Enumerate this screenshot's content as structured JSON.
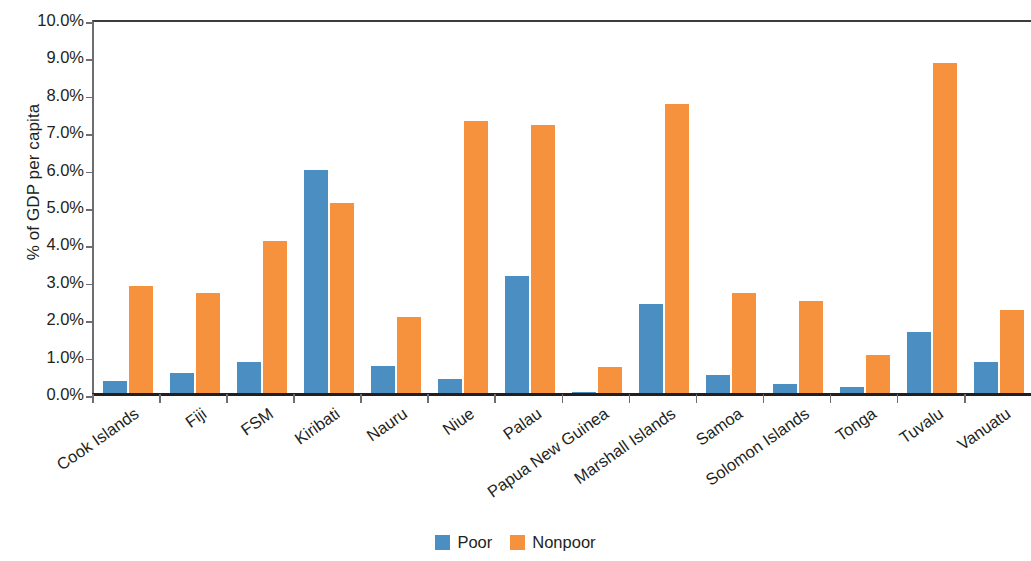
{
  "chart_data": {
    "type": "bar",
    "title": "",
    "xlabel": "",
    "ylabel": "% of GDP per capita",
    "ylim": [
      0,
      10
    ],
    "ytick_labels": [
      "10.0%",
      "9.0%",
      "8.0%",
      "7.0%",
      "6.0%",
      "5.0%",
      "4.0%",
      "3.0%",
      "2.0%",
      "1.0%",
      "0.0%"
    ],
    "ytick_values": [
      10,
      9,
      8,
      7,
      6,
      5,
      4,
      3,
      2,
      1,
      0
    ],
    "grid": false,
    "legend_position": "bottom-center",
    "categories": [
      "Cook Islands",
      "Fiji",
      "FSM",
      "Kiribati",
      "Nauru",
      "Niue",
      "Palau",
      "Papua New Guinea",
      "Marshall Islands",
      "Samoa",
      "Solomon Islands",
      "Tonga",
      "Tuvalu",
      "Vanuatu"
    ],
    "series": [
      {
        "name": "Poor",
        "color": "#4a8ec2",
        "values": [
          0.35,
          0.55,
          0.85,
          6.0,
          0.75,
          0.4,
          3.15,
          0.05,
          2.4,
          0.5,
          0.28,
          0.18,
          1.65,
          0.85
        ]
      },
      {
        "name": "Nonpoor",
        "color": "#f6913d",
        "values": [
          2.9,
          2.7,
          4.1,
          5.1,
          2.05,
          7.3,
          7.2,
          0.72,
          7.75,
          2.7,
          2.5,
          1.05,
          8.85,
          2.25
        ]
      }
    ]
  },
  "legend": {
    "items": [
      {
        "label": "Poor",
        "color": "#4a8ec2"
      },
      {
        "label": "Nonpoor",
        "color": "#f6913d"
      }
    ]
  },
  "colors": {
    "poor": "#4a8ec2",
    "nonpoor": "#f6913d",
    "axis": "#231f20"
  }
}
